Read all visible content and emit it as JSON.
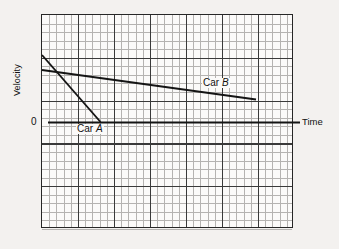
{
  "figure": {
    "kind": "line-graph",
    "background_color": "#f3f1ef",
    "plot_background_color": "#fbfaf9",
    "axis_color": "#141414",
    "major_grid_color": "#3a3a3a",
    "minor_grid_color": "#b5b3b1"
  },
  "axes": {
    "y_title": "Velocity",
    "x_title": "Time",
    "zero_label": "0"
  },
  "series_labels": {
    "car_a": {
      "prefix": "Car ",
      "name": "A"
    },
    "car_b": {
      "prefix": "Car ",
      "name": "B"
    }
  },
  "chart_data": {
    "type": "line",
    "title": "",
    "xlabel": "Time",
    "ylabel": "Velocity",
    "xlim": [
      0,
      7
    ],
    "ylim": [
      -2.5,
      2.5
    ],
    "grid": true,
    "minor_grid": true,
    "major_grid_spacing": {
      "x": 1,
      "y": 1
    },
    "minor_grid_divisions": {
      "x": 5,
      "y": 5
    },
    "legend": "inline-annotations",
    "zero_axis_y": 0,
    "series": [
      {
        "name": "Car A",
        "label": "Car A",
        "x": [
          0.02,
          1.65
        ],
        "values": [
          1.58,
          0.0
        ],
        "slope": -0.96,
        "description": "steep negative slope, reaches zero velocity early"
      },
      {
        "name": "Car B",
        "label": "Car B",
        "x": [
          0.02,
          6.0
        ],
        "values": [
          1.23,
          0.55
        ],
        "slope": -0.11,
        "description": "shallow negative slope, still positive at end"
      }
    ],
    "annotations": [
      {
        "text": "Car A",
        "x": 1.05,
        "y": -0.15
      },
      {
        "text": "Car B",
        "x": 4.6,
        "y": 0.92
      }
    ]
  }
}
